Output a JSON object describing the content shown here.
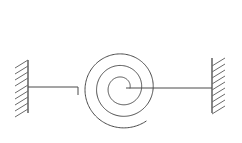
{
  "diagram": {
    "type": "mechanical-schematic",
    "background_color": "#ffffff",
    "line_color": "#4a4a4a",
    "wall_color": "#555555",
    "hatch_color": "#6b6b6b",
    "canvas": {
      "width": 242,
      "height": 143
    },
    "elements": {
      "left_wall": {
        "label": "left fixed support",
        "x": 28,
        "y_top": 60,
        "y_bottom": 113,
        "hatch_side": "left",
        "hatch_count": 9,
        "hatch_length": 13,
        "hatch_spacing": 6.2,
        "hatch_dx": -13,
        "hatch_dy": 8
      },
      "right_wall": {
        "label": "right fixed support",
        "x": 212,
        "y_top": 58,
        "y_bottom": 113,
        "hatch_side": "right",
        "hatch_count": 9,
        "hatch_length": 13,
        "hatch_spacing": 6.2,
        "hatch_dx": 13,
        "hatch_dy": -8
      },
      "left_link": {
        "label": "left connecting rod",
        "x_start": 28,
        "x_end": 78,
        "y": 87,
        "step_down_to_y": 95
      },
      "right_link": {
        "label": "right connecting rod",
        "x_start": 126,
        "x_end": 212,
        "y": 88
      },
      "spiral": {
        "label": "spiral coil spring",
        "center_x": 122,
        "center_y": 88,
        "turns": 2.85,
        "start_radius": 8,
        "end_radius": 41,
        "start_angle_deg": 0,
        "direction": "counterclockwise",
        "inner_terminus": {
          "x": 126,
          "y": 88
        },
        "outer_terminus": {
          "x": 78,
          "y": 95
        }
      }
    }
  }
}
